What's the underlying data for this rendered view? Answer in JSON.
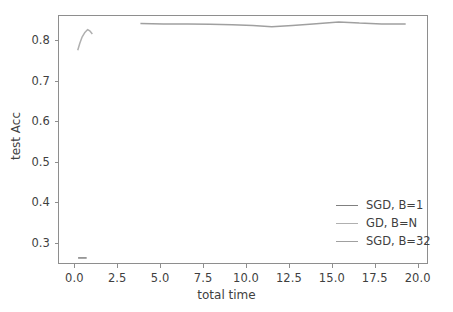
{
  "chart_data": {
    "type": "line",
    "title": "",
    "xlabel": "total time",
    "ylabel": "test Acc",
    "xlim": [
      -0.95,
      20.6
    ],
    "ylim": [
      0.247,
      0.862
    ],
    "xticks": [
      0.0,
      2.5,
      5.0,
      7.5,
      10.0,
      12.5,
      15.0,
      17.5,
      20.0
    ],
    "xticklabels": [
      "0.0",
      "2.5",
      "5.0",
      "7.5",
      "10.0",
      "12.5",
      "15.0",
      "17.5",
      "20.0"
    ],
    "yticks": [
      0.3,
      0.4,
      0.5,
      0.6,
      0.7,
      0.8
    ],
    "yticklabels": [
      "0.3",
      "0.4",
      "0.5",
      "0.6",
      "0.7",
      "0.8"
    ],
    "grid": false,
    "legend_position": "lower right",
    "legend_frame": false,
    "series": [
      {
        "name": "SGD, B=1",
        "color": "#808080",
        "x": [
          0.22,
          0.72
        ],
        "y": [
          0.262,
          0.262
        ]
      },
      {
        "name": "GD, B=N",
        "color": "#b0b0b0",
        "x": [
          0.2,
          0.32,
          0.46,
          0.6,
          0.78,
          0.92,
          1.05
        ],
        "y": [
          0.775,
          0.792,
          0.808,
          0.818,
          0.826,
          0.822,
          0.815
        ]
      },
      {
        "name": "SGD, B=32",
        "color": "#a0a0a0",
        "x": [
          3.85,
          5.2,
          6.6,
          7.9,
          9.2,
          10.4,
          11.5,
          12.7,
          13.9,
          15.4,
          16.6,
          17.9,
          19.3
        ],
        "y": [
          0.841,
          0.84,
          0.84,
          0.839,
          0.838,
          0.836,
          0.833,
          0.836,
          0.84,
          0.845,
          0.842,
          0.84,
          0.84
        ]
      }
    ]
  },
  "legend": {
    "entries": [
      {
        "label": "SGD, B=1",
        "color": "#808080"
      },
      {
        "label": "GD, B=N",
        "color": "#b0b0b0"
      },
      {
        "label": "SGD, B=32",
        "color": "#a0a0a0"
      }
    ]
  },
  "axes": {
    "frame_color": "#8e8e8e",
    "background": "#ffffff"
  }
}
